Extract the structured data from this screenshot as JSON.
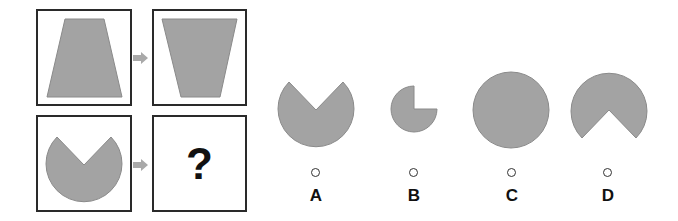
{
  "puzzle": {
    "question_mark": "?",
    "colors": {
      "shape_fill": "#a3a3a3",
      "shape_stroke": "#8a8a8a",
      "border": "#2a2a2a",
      "arrow": "#a9a9a9"
    },
    "grid": [
      {
        "position": "top-left",
        "shape": "trapezoid-wide-bottom"
      },
      {
        "position": "top-right",
        "shape": "trapezoid-wide-top"
      },
      {
        "position": "bottom-left",
        "shape": "circle-notch-top"
      },
      {
        "position": "bottom-right",
        "shape": "question"
      }
    ]
  },
  "options": [
    {
      "label": "A",
      "shape": "circle-notch-top-large"
    },
    {
      "label": "B",
      "shape": "small-circle-missing-quadrant"
    },
    {
      "label": "C",
      "shape": "full-circle"
    },
    {
      "label": "D",
      "shape": "circle-notch-bottom"
    }
  ]
}
